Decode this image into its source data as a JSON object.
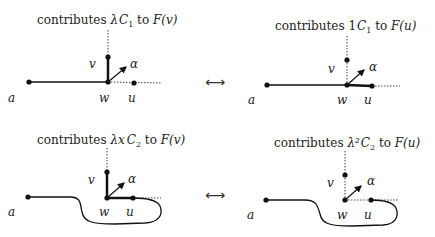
{
  "panels": [
    {
      "id": "top-left",
      "caption": {
        "prefix": "contributes ",
        "coef": "λ",
        "term": "C",
        "sub": "1",
        "mid": " to ",
        "target": "F(v)"
      },
      "labels": {
        "a": "a",
        "v": "v",
        "w": "w",
        "u": "u",
        "alpha": "α"
      }
    },
    {
      "id": "top-right",
      "caption": {
        "prefix": "contributes ",
        "coef": "1",
        "term": "C",
        "sub": "1",
        "mid": " to ",
        "target": "F(u)"
      },
      "labels": {
        "a": "a",
        "v": "v",
        "w": "w",
        "u": "u",
        "alpha": "α"
      }
    },
    {
      "id": "bottom-left",
      "caption": {
        "prefix": "contributes ",
        "coef": "λx",
        "term": "C",
        "sub": "2",
        "mid": " to ",
        "target": "F(v)"
      },
      "labels": {
        "a": "a",
        "v": "v",
        "w": "w",
        "u": "u",
        "alpha": "α"
      }
    },
    {
      "id": "bottom-right",
      "caption": {
        "prefix": "contributes ",
        "coef": "λ²",
        "term": "C",
        "sub": "2",
        "mid": " to ",
        "target": "F(u)"
      },
      "labels": {
        "a": "a",
        "v": "v",
        "w": "w",
        "u": "u",
        "alpha": "α"
      }
    }
  ],
  "correspondence_symbol": "⟷"
}
